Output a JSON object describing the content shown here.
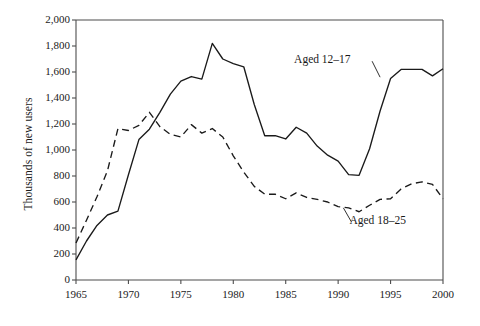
{
  "chart_data": {
    "type": "line",
    "title": "",
    "xlabel": "",
    "ylabel": "Thousands of new users",
    "xlim": [
      1965,
      2000
    ],
    "ylim": [
      0,
      2000
    ],
    "grid": false,
    "legend_position": "inline-annotation",
    "xticks": [
      "1965",
      "1970",
      "1975",
      "1980",
      "1985",
      "1990",
      "1995",
      "2000"
    ],
    "xtick_values": [
      1965,
      1970,
      1975,
      1980,
      1985,
      1990,
      1995,
      2000
    ],
    "yticks": [
      "0",
      "200",
      "400",
      "600",
      "800",
      "1,000",
      "1,200",
      "1,400",
      "1,600",
      "1,800",
      "2,000"
    ],
    "ytick_values": [
      0,
      200,
      400,
      600,
      800,
      1000,
      1200,
      1400,
      1600,
      1800,
      2000
    ],
    "x": [
      1965,
      1966,
      1967,
      1968,
      1969,
      1970,
      1971,
      1972,
      1973,
      1974,
      1975,
      1976,
      1977,
      1978,
      1979,
      1980,
      1981,
      1982,
      1983,
      1984,
      1985,
      1986,
      1987,
      1988,
      1989,
      1990,
      1991,
      1992,
      1993,
      1994,
      1995,
      1996,
      1997,
      1998,
      1999,
      2000
    ],
    "series": [
      {
        "name": "Aged 12-17",
        "style": "solid",
        "color": "#1a1a1a",
        "label": "Aged 12–17",
        "values": [
          155,
          300,
          420,
          500,
          530,
          810,
          1080,
          1160,
          1290,
          1430,
          1530,
          1565,
          1545,
          1820,
          1700,
          1665,
          1640,
          1350,
          1110,
          1110,
          1085,
          1175,
          1130,
          1030,
          960,
          915,
          810,
          805,
          1010,
          1300,
          1550,
          1620,
          1620,
          1620,
          1570,
          1625
        ]
      },
      {
        "name": "Aged 18-25",
        "style": "dashed",
        "color": "#1a1a1a",
        "label": "Aged 18–25",
        "values": [
          285,
          460,
          640,
          840,
          1165,
          1150,
          1190,
          1290,
          1180,
          1120,
          1100,
          1195,
          1130,
          1165,
          1100,
          955,
          830,
          720,
          660,
          660,
          625,
          670,
          635,
          620,
          600,
          565,
          555,
          525,
          575,
          620,
          625,
          700,
          740,
          755,
          735,
          625
        ]
      }
    ],
    "annotations": [
      {
        "text": "Aged 12–17",
        "target_x": 1994.0,
        "target_y": 1560
      },
      {
        "text": "Aged 18–25",
        "target_x": 1990.5,
        "target_y": 555
      }
    ]
  }
}
